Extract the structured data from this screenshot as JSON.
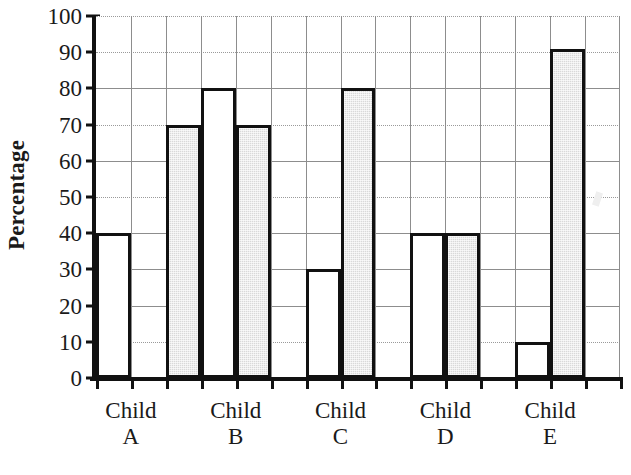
{
  "chart_data": {
    "type": "bar",
    "title": "",
    "subtitle": "",
    "xlabel": "",
    "ylabel": "Percentage",
    "ylim": [
      0,
      100
    ],
    "ytick_step": 10,
    "yticks": [
      0,
      10,
      20,
      30,
      40,
      50,
      60,
      70,
      80,
      90,
      100
    ],
    "ytick_labels": [
      "0",
      "10",
      "20",
      "30",
      "40",
      "50",
      "60",
      "70",
      "80",
      "90",
      "100"
    ],
    "categories": [
      "Child A",
      "Child B",
      "Child C",
      "Child D",
      "Child E"
    ],
    "category_lines": [
      {
        "line1": "Child",
        "line2": "A"
      },
      {
        "line1": "Child",
        "line2": "B"
      },
      {
        "line1": "Child",
        "line2": "C"
      },
      {
        "line1": "Child",
        "line2": "D"
      },
      {
        "line1": "Child",
        "line2": "E"
      }
    ],
    "series": [
      {
        "name": "white",
        "fill": "#ffffff",
        "values": [
          40,
          80,
          30,
          40,
          10
        ]
      },
      {
        "name": "gray",
        "fill": "#d9d9d9",
        "values": [
          70,
          70,
          80,
          40,
          91
        ]
      }
    ],
    "grid": {
      "horizontal": true,
      "vertical": true,
      "horizontal_style_by_value": {
        "10": "dotted",
        "20": "solid",
        "30": "solid",
        "40": "solid",
        "50": "dotted",
        "60": "solid",
        "70": "dotted",
        "80": "solid",
        "90": "dotted",
        "100": "dotted"
      }
    },
    "legend": {
      "visible": false,
      "position": "none"
    },
    "bars": [
      {
        "child": "Child A",
        "series": "white",
        "value": 40,
        "column": 1
      },
      {
        "child": "Child A",
        "series": "gray",
        "value": 70,
        "column": 3
      },
      {
        "child": "Child B",
        "series": "white",
        "value": 80,
        "column": 4
      },
      {
        "child": "Child B",
        "series": "gray",
        "value": 70,
        "column": 5
      },
      {
        "child": "Child C",
        "series": "white",
        "value": 30,
        "column": 7
      },
      {
        "child": "Child C",
        "series": "gray",
        "value": 80,
        "column": 8
      },
      {
        "child": "Child D",
        "series": "white",
        "value": 40,
        "column": 10
      },
      {
        "child": "Child D",
        "series": "gray",
        "value": 40,
        "column": 11
      },
      {
        "child": "Child E",
        "series": "white",
        "value": 10,
        "column": 13
      },
      {
        "child": "Child E",
        "series": "gray",
        "value": 91,
        "column": 14
      }
    ]
  },
  "colors": {
    "axis": "#111111",
    "gridline": "#8d8d8d",
    "bar_outline": "#111111",
    "bar_white_fill": "#ffffff",
    "bar_gray_fill": "#d9d9d9",
    "background": "#ffffff",
    "text": "#1a1a1a"
  }
}
